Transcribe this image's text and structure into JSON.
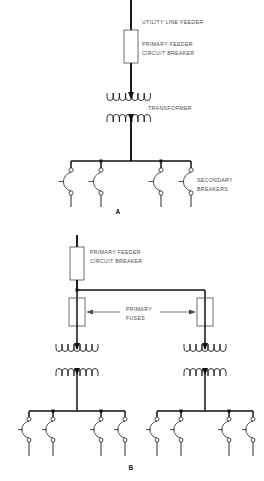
{
  "figure": {
    "title_a": "A",
    "title_b": "B",
    "stroke_color": "#111111",
    "text_color": "#4a4a4a",
    "background": "#ffffff"
  },
  "diagram_a": {
    "labels": {
      "utility_line_feeder": "UTILITY LINE FEEDER",
      "primary_feeder_line1": "PRIMARY FEEDER",
      "primary_feeder_line2": "CIRCUIT BREAKER",
      "transformer": "TRANSFORMER",
      "secondary_breakers_line1": "SECONDARY",
      "secondary_breakers_line2": "BREAKERS"
    },
    "components": {
      "primary_feeder_circuit_breakers": 1,
      "transformers": 1,
      "secondary_breakers": 4,
      "bus_junction_dots": 2
    }
  },
  "diagram_b": {
    "labels": {
      "primary_feeder_line1": "PRIMARY FEEDER",
      "primary_feeder_line2": "CIRCUIT BREAKER",
      "primary_fuses_line1": "PRIMARY",
      "primary_fuses_line2": "FUSES"
    },
    "components": {
      "primary_feeder_circuit_breakers": 1,
      "primary_fuses": 2,
      "transformers": 2,
      "secondary_breakers_per_bank": 4,
      "secondary_breakers_total": 8
    }
  }
}
